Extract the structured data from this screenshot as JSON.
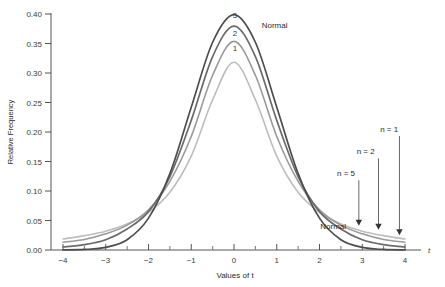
{
  "chart_data": {
    "type": "line",
    "title": "",
    "xlabel": "Values of t",
    "ylabel": "Relative Frequency",
    "xlim": [
      -4,
      4
    ],
    "ylim": [
      0.0,
      0.4
    ],
    "grid": false,
    "legend_position": "inline-curve-labels",
    "x_ticks": [
      "-4",
      "-3",
      "-2",
      "-1",
      "0",
      "1",
      "2",
      "3",
      "4"
    ],
    "x_tick_values": [
      -4,
      -3,
      -2,
      -1,
      0,
      1,
      2,
      3,
      4
    ],
    "x_minor_ticks": [
      -3.5,
      -2.5,
      -1.5,
      -0.5,
      0.5,
      1.5,
      2.5,
      3.5
    ],
    "y_ticks": [
      "0.00",
      "0.05",
      "0.10",
      "0.15",
      "0.20",
      "0.25",
      "0.30",
      "0.35",
      "0.40"
    ],
    "y_tick_values": [
      0.0,
      0.05,
      0.1,
      0.15,
      0.2,
      0.25,
      0.3,
      0.35,
      0.4
    ],
    "axis_end_label": "t",
    "series": [
      {
        "name": "Normal",
        "label": "Normal",
        "color": "#4d4d4d",
        "peak_value": 0.399,
        "peak_x": 0,
        "x": [
          -4.0,
          -3.5,
          -3.0,
          -2.5,
          -2.0,
          -1.5,
          -1.0,
          -0.5,
          0.0,
          0.5,
          1.0,
          1.5,
          2.0,
          2.5,
          3.0,
          3.5,
          4.0
        ],
        "values": [
          0.0001,
          0.0009,
          0.0044,
          0.0175,
          0.054,
          0.1295,
          0.242,
          0.3521,
          0.3989,
          0.3521,
          0.242,
          0.1295,
          0.054,
          0.0175,
          0.0044,
          0.0009,
          0.0001
        ]
      },
      {
        "name": "n = 5",
        "label": "5",
        "color": "#6b6b6b",
        "peak_value": 0.3796,
        "peak_x": 0,
        "x": [
          -4.0,
          -3.5,
          -3.0,
          -2.5,
          -2.0,
          -1.5,
          -1.0,
          -0.5,
          0.0,
          0.5,
          1.0,
          1.5,
          2.0,
          2.5,
          3.0,
          3.5,
          4.0
        ],
        "values": [
          0.0051,
          0.009,
          0.0173,
          0.0356,
          0.0651,
          0.1245,
          0.2197,
          0.3279,
          0.3796,
          0.3279,
          0.2197,
          0.1245,
          0.0651,
          0.0356,
          0.0173,
          0.009,
          0.0051
        ]
      },
      {
        "name": "n = 2",
        "label": "2",
        "color": "#9a9a9a",
        "peak_value": 0.3536,
        "peak_x": 0,
        "x": [
          -4.0,
          -3.5,
          -3.0,
          -2.5,
          -2.0,
          -1.5,
          -1.0,
          -0.5,
          0.0,
          0.5,
          1.0,
          1.5,
          2.0,
          2.5,
          3.0,
          3.5,
          4.0
        ],
        "values": [
          0.0131,
          0.0179,
          0.0274,
          0.0422,
          0.068,
          0.1163,
          0.1924,
          0.2962,
          0.3536,
          0.2962,
          0.1924,
          0.1163,
          0.068,
          0.0422,
          0.0274,
          0.0179,
          0.0131
        ]
      },
      {
        "name": "n = 1",
        "label": "1",
        "color": "#bdbdbd",
        "peak_value": 0.3183,
        "peak_x": 0,
        "x": [
          -4.0,
          -3.5,
          -3.0,
          -2.5,
          -2.0,
          -1.5,
          -1.0,
          -0.5,
          0.0,
          0.5,
          1.0,
          1.5,
          2.0,
          2.5,
          3.0,
          3.5,
          4.0
        ],
        "values": [
          0.0187,
          0.0243,
          0.0318,
          0.0439,
          0.0637,
          0.0979,
          0.1592,
          0.2546,
          0.3183,
          0.2546,
          0.1592,
          0.0979,
          0.0637,
          0.0439,
          0.0318,
          0.0243,
          0.0187
        ]
      }
    ],
    "curve_peak_labels": [
      {
        "text": "5",
        "x": 0.02,
        "y": 0.393
      },
      {
        "text": "2",
        "x": 0.02,
        "y": 0.363
      },
      {
        "text": "1",
        "x": 0.02,
        "y": 0.337
      }
    ],
    "annotations": [
      {
        "text": "Normal",
        "kind": "curve-label-top",
        "x": 0.95,
        "y": 0.377
      },
      {
        "text": "Normal",
        "kind": "curve-label-tail",
        "x": 2.32,
        "y": 0.036
      },
      {
        "text": "n = 5",
        "kind": "arrow-label",
        "x": 2.62,
        "y": 0.125,
        "arrow_tip_x": 2.92,
        "arrow_tip_y": 0.042
      },
      {
        "text": "n = 2",
        "kind": "arrow-label",
        "x": 3.08,
        "y": 0.162,
        "arrow_tip_x": 3.38,
        "arrow_tip_y": 0.035
      },
      {
        "text": "n = 1",
        "kind": "arrow-label",
        "x": 3.63,
        "y": 0.2,
        "arrow_tip_x": 3.87,
        "arrow_tip_y": 0.026
      }
    ]
  }
}
